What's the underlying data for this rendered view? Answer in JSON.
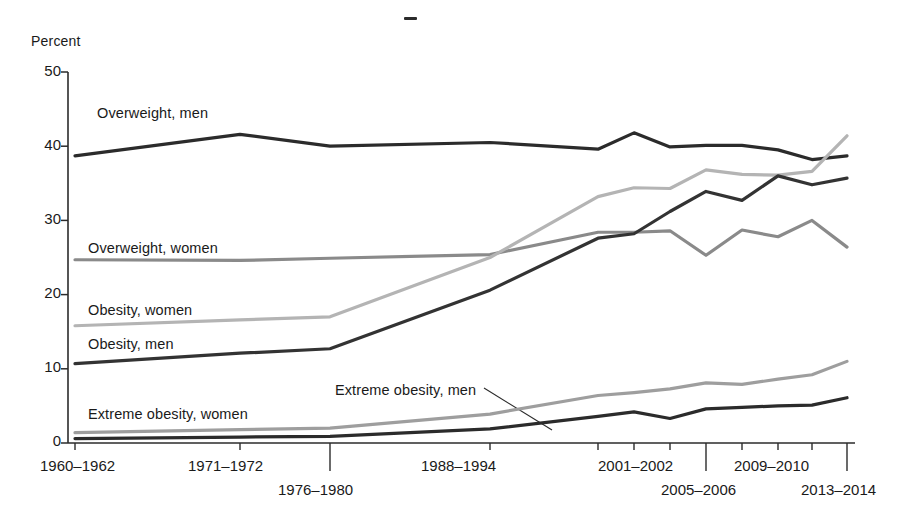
{
  "chart_data": {
    "type": "line",
    "title": "",
    "ylabel": "Percent",
    "xlabel": "",
    "ylim": [
      0,
      50
    ],
    "yticks": [
      0,
      10,
      20,
      30,
      40,
      50
    ],
    "grid": false,
    "legend": "inline-labels",
    "categories": [
      "1960–1962",
      "1971–1972",
      "1976–1980",
      "1988–1994",
      "1999–2000",
      "2001–2002",
      "2003–2004",
      "2005–2006",
      "2007–2008",
      "2009–2010",
      "2011–2012",
      "2013–2014"
    ],
    "tick_labels_shown": [
      "1960–1962",
      "1971–1972",
      "1976–1980",
      "1988–1994",
      "2001–2002",
      "2005–2006",
      "2009–2010",
      "2013–2014"
    ],
    "series": [
      {
        "name": "Overweight, men",
        "color": "#2b2b2b",
        "values": [
          38.7,
          41.6,
          40.0,
          40.5,
          39.6,
          41.8,
          39.9,
          40.1,
          40.1,
          39.5,
          38.2,
          38.7
        ]
      },
      {
        "name": "Overweight, women",
        "color": "#8a8a8a",
        "values": [
          24.7,
          24.6,
          24.9,
          25.4,
          28.4,
          28.4,
          28.6,
          25.3,
          28.7,
          27.8,
          30.0,
          26.4
        ]
      },
      {
        "name": "Obesity, women",
        "color": "#b4b4b4",
        "values": [
          15.8,
          16.6,
          17.0,
          25.0,
          33.2,
          34.4,
          34.3,
          36.8,
          36.2,
          36.1,
          36.6,
          41.4
        ]
      },
      {
        "name": "Obesity, men",
        "color": "#333333",
        "values": [
          10.7,
          12.1,
          12.7,
          20.6,
          27.6,
          28.2,
          31.2,
          33.9,
          32.7,
          36.0,
          34.8,
          35.7
        ]
      },
      {
        "name": "Extreme obesity, women",
        "color": "#9e9e9e",
        "values": [
          1.4,
          1.8,
          2.0,
          3.9,
          6.4,
          6.8,
          7.3,
          8.1,
          7.9,
          8.6,
          9.2,
          11.0
        ]
      },
      {
        "name": "Extreme obesity, men",
        "color": "#2b2b2b",
        "values": [
          0.6,
          0.8,
          0.9,
          1.9,
          3.6,
          4.2,
          3.3,
          4.6,
          4.8,
          5.0,
          5.1,
          6.1
        ]
      }
    ],
    "annotations": [
      {
        "text": "Overweight, men",
        "x": 97,
        "y": 114
      },
      {
        "text": "Overweight, women",
        "x": 88,
        "y": 249
      },
      {
        "text": "Obesity, women",
        "x": 88,
        "y": 311
      },
      {
        "text": "Obesity, men",
        "x": 88,
        "y": 345
      },
      {
        "text": "Extreme obesity, men",
        "x": 335,
        "y": 391
      },
      {
        "text": "Extreme obesity, women",
        "x": 88,
        "y": 415
      }
    ]
  },
  "axes": {
    "y_title": "Percent",
    "y_tick_labels": [
      "50",
      "40",
      "30",
      "20",
      "10",
      "0"
    ],
    "x_tick_labels_row1": [
      "1960–1962",
      "1971–1972",
      "1988–1994",
      "2001–2002",
      "2009–2010"
    ],
    "x_tick_labels_row2": [
      "1976–1980",
      "2005–2006",
      "2013–2014"
    ]
  },
  "labels": {
    "overweight_men": "Overweight, men",
    "overweight_women": "Overweight, women",
    "obesity_women": "Obesity, women",
    "obesity_men": "Obesity, men",
    "extreme_obesity_men": "Extreme obesity, men",
    "extreme_obesity_women": "Extreme obesity, women"
  }
}
